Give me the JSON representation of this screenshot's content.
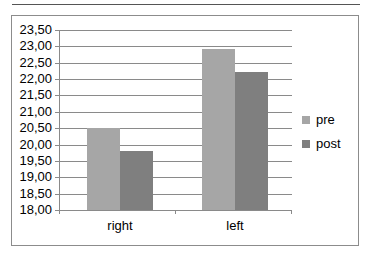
{
  "chart_data": {
    "type": "bar",
    "title": "",
    "xlabel": "",
    "ylabel": "",
    "categories": [
      "right",
      "left"
    ],
    "series": [
      {
        "name": "pre",
        "color": "#a6a6a6",
        "values": [
          20.52,
          22.92
        ]
      },
      {
        "name": "post",
        "color": "#7f7f7f",
        "values": [
          19.8,
          22.22
        ]
      }
    ],
    "ylim": [
      18.0,
      23.5
    ],
    "yticks": [
      "23,50",
      "23,00",
      "22,50",
      "22,00",
      "21,50",
      "21,00",
      "20,50",
      "20,00",
      "19,50",
      "19,00",
      "18,50",
      "18,00"
    ],
    "grid": true,
    "legend_position": "right"
  },
  "legend": {
    "pre": "pre",
    "post": "post"
  },
  "axis": {
    "x_labels": [
      "right",
      "left"
    ]
  }
}
